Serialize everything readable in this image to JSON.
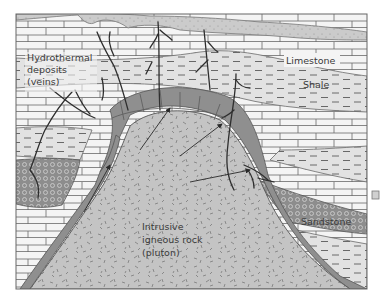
{
  "diagram": {
    "colors": {
      "background": "#ffffff",
      "topsoil": "#c9c9c9",
      "limestone": "#f4f4f4",
      "shale": "#e2e2e2",
      "sandstone": "#8d8d8d",
      "pluton": "#c4c4c4",
      "alteration_halo": "#8f8f8f",
      "vein": "#2e2e2e",
      "outline": "#555555",
      "text": "#3a3a3a"
    },
    "labels": {
      "hydrothermal_line1": "Hydrothermal",
      "hydrothermal_line2": "deposits",
      "hydrothermal_line3": "(veins)",
      "limestone": "Limestone",
      "shale": "Shale",
      "sandstone": "Sandstone",
      "pluton_line1": "Intrusive",
      "pluton_line2": "igneous rock",
      "pluton_line3": "(pluton)"
    },
    "layers": [
      "Topsoil",
      "Limestone",
      "Shale",
      "Limestone",
      "Sandstone",
      "Shale",
      "Intrusive igneous rock (pluton)"
    ],
    "arrows_from_pluton": 4
  }
}
